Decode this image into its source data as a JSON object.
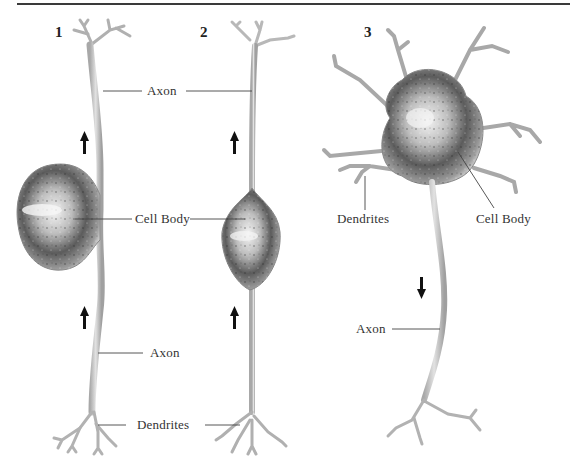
{
  "figure": {
    "panels": [
      {
        "number": "1",
        "labels": {
          "axon_top": "Axon",
          "cell_body": "Cell Body",
          "axon_bottom": "Axon",
          "dendrites": "Dendrites"
        },
        "arrow_direction": "up"
      },
      {
        "number": "2",
        "labels": {
          "cell_body": "Cell Body"
        },
        "arrow_direction": "up"
      },
      {
        "number": "3",
        "labels": {
          "dendrites": "Dendrites",
          "cell_body": "Cell Body",
          "axon": "Axon"
        },
        "arrow_direction": "down"
      }
    ],
    "shared_labels": {
      "axon_top": "Axon",
      "dendrites_bottom": "Dendrites"
    },
    "colors": {
      "rule": "#3a3a3a",
      "neuron_fill": "#d8d8d8",
      "neuron_shade": "#5a5a5a",
      "leader_line": "#444444",
      "arrow": "#111111"
    }
  }
}
